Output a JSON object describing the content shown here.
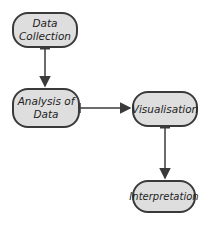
{
  "diagram": {
    "type": "flowchart",
    "nodes": [
      {
        "id": "data-collection",
        "label": "Data Collection"
      },
      {
        "id": "analysis",
        "label": "Analysis of Data"
      },
      {
        "id": "visualisation",
        "label": "Visualisation"
      },
      {
        "id": "interpretation",
        "label": "Interpretation"
      }
    ],
    "edges": [
      {
        "from": "data-collection",
        "to": "analysis"
      },
      {
        "from": "analysis",
        "to": "visualisation"
      },
      {
        "from": "visualisation",
        "to": "interpretation"
      }
    ],
    "colors": {
      "node_fill": "#dedede",
      "stroke": "#3a3a3a"
    }
  },
  "labels": {
    "n1_line1": "Data",
    "n1_line2": "Collection",
    "n2_line1": "Analysis of",
    "n2_line2": "Data",
    "n3": "Visualisation",
    "n4": "Interpretation"
  }
}
